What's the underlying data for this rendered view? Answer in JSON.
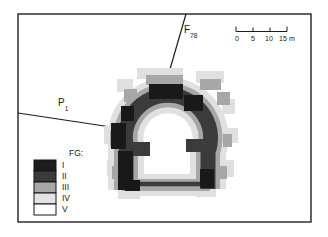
{
  "labels": {
    "fault": {
      "main": "F",
      "sub": "78"
    },
    "profile": {
      "main": "P",
      "sub": "1"
    }
  },
  "scale_bar": {
    "ticks": [
      "0",
      "5",
      "10",
      "15"
    ],
    "unit": "m"
  },
  "legend": {
    "title": "FG:",
    "items": [
      {
        "label": "I",
        "color": "#1d1d1d"
      },
      {
        "label": "II",
        "color": "#3b3b3b"
      },
      {
        "label": "III",
        "color": "#a7a7a7"
      },
      {
        "label": "IV",
        "color": "#e3e3e3"
      },
      {
        "label": "V",
        "color": "#ffffff"
      }
    ]
  },
  "map": {
    "bands": {
      "I": "#191919",
      "II": "#3b3b3b",
      "III": "#a7a7a7",
      "IV": "#e0e0e0",
      "V": "#ffffff"
    }
  }
}
